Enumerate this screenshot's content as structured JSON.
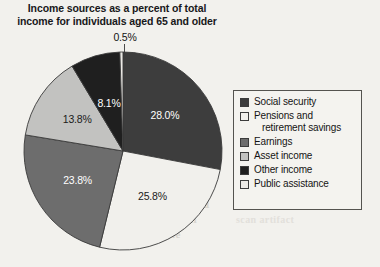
{
  "title": "Income sources as a percent of total income for individuals aged 65 and older",
  "title_line1": "Income sources as a percent of total",
  "title_line2": "income for individuals aged 65 and older",
  "callout": {
    "label": "0.5%",
    "for_series": "Public assistance"
  },
  "legend": {
    "items": [
      {
        "label": "Social security",
        "label_line1": "Social security",
        "label_line2": "",
        "color": "#3d3d3d"
      },
      {
        "label": "Pensions and retirement savings",
        "label_line1": "Pensions and",
        "label_line2": "retirement savings",
        "color": "#f1f0ec"
      },
      {
        "label": "Earnings",
        "label_line1": "Earnings",
        "label_line2": "",
        "color": "#6d6d6d"
      },
      {
        "label": "Asset income",
        "label_line1": "Asset income",
        "label_line2": "",
        "color": "#c2c2c0"
      },
      {
        "label": "Other income",
        "label_line1": "Other income",
        "label_line2": "",
        "color": "#1f1f1f"
      },
      {
        "label": "Public assistance",
        "label_line1": "Public assistance",
        "label_line2": "",
        "color": "#eceae6"
      }
    ]
  },
  "slice_labels": {
    "social_security": "28.0%",
    "pensions": "25.8%",
    "earnings": "23.8%",
    "asset_income": "13.8%",
    "other_income": "8.1%",
    "public_assistance": "0.5%"
  },
  "bleed_text": {
    "a": "Image not found",
    "b": "or type unknown",
    "c": "unavailable",
    "d": "scan artifact"
  },
  "chart_data": {
    "type": "pie",
    "title": "Income sources as a percent of total income for individuals aged 65 and older",
    "xlabel": "",
    "ylabel": "",
    "unit": "percent",
    "total": 100.0,
    "start_angle_deg": 0,
    "direction": "clockwise",
    "legend_position": "right",
    "grid": false,
    "labels_shown_on_slices": true,
    "categories": [
      "Social security",
      "Pensions and retirement savings",
      "Earnings",
      "Asset income",
      "Other income",
      "Public assistance"
    ],
    "values": [
      28.0,
      25.8,
      23.8,
      13.8,
      8.1,
      0.5
    ],
    "colors": [
      "#3d3d3d",
      "#f1f0ec",
      "#6d6d6d",
      "#c2c2c0",
      "#1f1f1f",
      "#eceae6"
    ],
    "slices": [
      {
        "name": "Social security",
        "value": 28.0,
        "label": "28.0%",
        "color": "#3d3d3d"
      },
      {
        "name": "Pensions and retirement savings",
        "value": 25.8,
        "label": "25.8%",
        "color": "#f1f0ec"
      },
      {
        "name": "Earnings",
        "value": 23.8,
        "label": "23.8%",
        "color": "#6d6d6d"
      },
      {
        "name": "Asset income",
        "value": 13.8,
        "label": "13.8%",
        "color": "#c2c2c0"
      },
      {
        "name": "Other income",
        "value": 8.1,
        "label": "8.1%",
        "color": "#1f1f1f"
      },
      {
        "name": "Public assistance",
        "value": 0.5,
        "label": "0.5%",
        "color": "#eceae6"
      }
    ]
  }
}
